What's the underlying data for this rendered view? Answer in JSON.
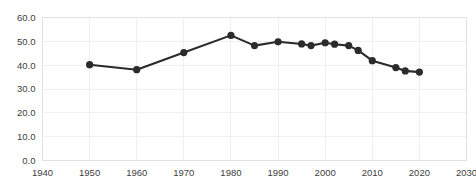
{
  "chart_data": {
    "type": "line",
    "title": "",
    "subtitle": "",
    "xlabel": "",
    "ylabel": "",
    "xlim": [
      1940,
      2030
    ],
    "ylim": [
      0,
      60
    ],
    "grid": true,
    "legend": false,
    "legend_position": "none",
    "line_color": "#2b2b2b",
    "marker": "circle",
    "x_tick_labels": [
      "1940",
      "1950",
      "1960",
      "1970",
      "1980",
      "1990",
      "2000",
      "2010",
      "2020",
      "2030"
    ],
    "x_ticks": [
      1940,
      1950,
      1960,
      1970,
      1980,
      1990,
      2000,
      2010,
      2020,
      2030
    ],
    "y_tick_labels": [
      "0.0",
      "10.0",
      "20.0",
      "30.0",
      "40.0",
      "50.0",
      "60.0"
    ],
    "y_ticks": [
      0,
      10,
      20,
      30,
      40,
      50,
      60
    ],
    "series": [
      {
        "name": "",
        "points": [
          {
            "x": 1950,
            "y": 40.2
          },
          {
            "x": 1960,
            "y": 38.1
          },
          {
            "x": 1970,
            "y": 45.3
          },
          {
            "x": 1980,
            "y": 52.5
          },
          {
            "x": 1985,
            "y": 48.2
          },
          {
            "x": 1990,
            "y": 49.8
          },
          {
            "x": 1995,
            "y": 48.9
          },
          {
            "x": 1997,
            "y": 48.2
          },
          {
            "x": 2000,
            "y": 49.4
          },
          {
            "x": 2002,
            "y": 48.8
          },
          {
            "x": 2005,
            "y": 48.2
          },
          {
            "x": 2007,
            "y": 46.2
          },
          {
            "x": 2010,
            "y": 41.9
          },
          {
            "x": 2015,
            "y": 39.0
          },
          {
            "x": 2017,
            "y": 37.6
          },
          {
            "x": 2020,
            "y": 37.1
          }
        ]
      }
    ]
  }
}
